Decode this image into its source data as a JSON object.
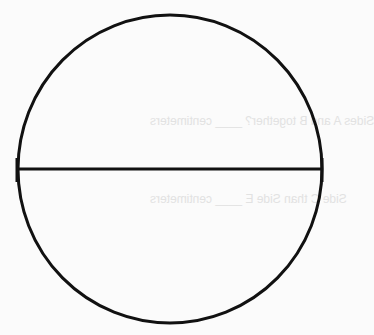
{
  "diagram": {
    "shape": "circle",
    "stroke_color": "#111111",
    "background_color": "#fbfbfb",
    "elements": [
      {
        "type": "circle",
        "cx": 170,
        "cy": 169,
        "rx": 152,
        "ry": 154
      },
      {
        "type": "line",
        "label": "diameter",
        "x1": 18,
        "y1": 169,
        "x2": 322,
        "y2": 169
      }
    ]
  },
  "bleed_through_text": [
    "Sides A and B together? ____ centimeters",
    "Side C than Side E ____ centimeters"
  ]
}
